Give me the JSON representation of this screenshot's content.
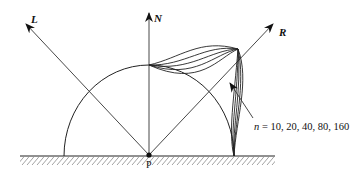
{
  "diagram": {
    "vectors": [
      {
        "id": "L",
        "label": "L"
      },
      {
        "id": "N",
        "label": "N"
      },
      {
        "id": "R",
        "label": "R"
      }
    ],
    "point_label": "P",
    "annotation": {
      "variable": "n",
      "equals": " = ",
      "values": "10, 20, 40, 80, 160"
    },
    "exponents": [
      10,
      20,
      40,
      80,
      160
    ],
    "colors": {
      "stroke": "#1a1a1a",
      "background": "#ffffff"
    }
  }
}
